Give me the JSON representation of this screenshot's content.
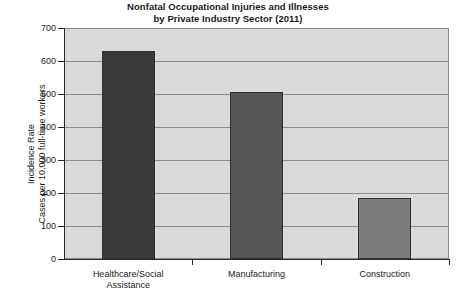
{
  "chart_data": {
    "type": "bar",
    "title": "Nonfatal Occupational Injuries and Illnesses by Private Industry Sector (2011)",
    "title_line1": "Nonfatal Occupational Injuries and Illnesses",
    "title_line2": "by Private Industry Sector (2011)",
    "xlabel": "",
    "ylabel": "Incidence Rate Cases per 10,000 full-time workers",
    "ylabel_line1": "Incidence Rate",
    "ylabel_line2": "Cases per 10,000 full-time workers",
    "categories": [
      "Healthcare/Social Assistance",
      "Manufacturing",
      "Construction"
    ],
    "category_lines": [
      [
        "Healthcare/Social",
        "Assistance"
      ],
      [
        "Manufacturing",
        ""
      ],
      [
        "Construction",
        ""
      ]
    ],
    "values": [
      630,
      505,
      185
    ],
    "bar_colors": [
      "#3a3a3a",
      "#555555",
      "#7c7c7c"
    ],
    "ylim": [
      0,
      700
    ],
    "yticks": [
      0,
      100,
      200,
      300,
      400,
      500,
      600,
      700
    ],
    "ytick_labels": [
      "0",
      "100",
      "200",
      "300",
      "400",
      "500",
      "600",
      "700"
    ],
    "grid": true,
    "legend": "none",
    "plot_background": "#d9d9d9",
    "gridline_color": "#8d8d8d",
    "axis_color": "#2a2a2a"
  }
}
